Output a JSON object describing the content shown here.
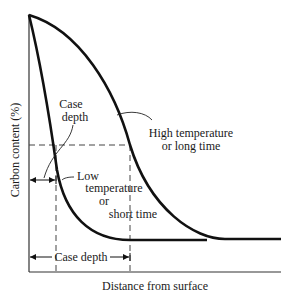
{
  "diagram": {
    "type": "carburizing-profile",
    "axes": {
      "ylabel": "Carbon content (%)",
      "xlabel": "Distance from surface"
    },
    "curves": [
      {
        "name": "low",
        "label_lines": [
          "Low",
          "temperature",
          "or",
          "short time"
        ]
      },
      {
        "name": "high",
        "label_lines": [
          "High temperature",
          "or long time"
        ]
      }
    ],
    "annotations": {
      "case_depth_upper": [
        "Case",
        "depth"
      ],
      "case_depth_lower": "Case depth"
    },
    "colors": {
      "line": "#111111",
      "axis": "#333333",
      "dash": "#444444"
    }
  }
}
